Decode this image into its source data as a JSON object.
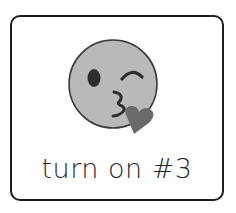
{
  "card": {
    "icon": "face-blowing-a-kiss-icon",
    "label": "turn on #3"
  },
  "colors": {
    "border": "#1e1e1e",
    "face_fill": "#b9b9b9",
    "face_outline": "#3a3a3a",
    "heart_fill": "#6a6a6a",
    "text": "#2a2a2a"
  }
}
